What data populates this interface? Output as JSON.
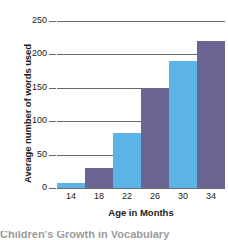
{
  "chart_data": {
    "type": "bar",
    "title": "",
    "xlabel": "Age in Months",
    "ylabel": "Average number of words used",
    "categories": [
      "14",
      "18",
      "22",
      "26",
      "30",
      "34"
    ],
    "values": [
      8,
      30,
      83,
      150,
      190,
      220
    ],
    "bar_colors": [
      "#5bb4e5",
      "#6b6391",
      "#5bb4e5",
      "#6b6391",
      "#5bb4e5",
      "#6b6391"
    ],
    "ylim": [
      0,
      250
    ],
    "yticks": [
      0,
      50,
      100,
      150,
      200,
      250
    ],
    "ytick_labels": [
      "0",
      "50",
      "100",
      "150",
      "200",
      "250"
    ],
    "grid": true,
    "legend": "none",
    "axis_color": "#6a6a6a",
    "text_color": "#1b1b1b"
  },
  "caption": {
    "cropped_line": "Children's Growth in Vocabulary"
  }
}
